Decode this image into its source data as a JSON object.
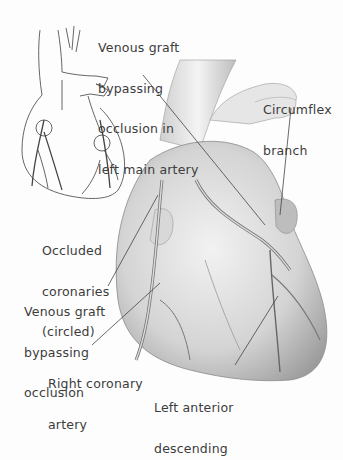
{
  "figure": {
    "background": "#fdfdfd",
    "ink": "#3c3c3c"
  },
  "labels": {
    "venous_graft_left_main": {
      "lines": [
        "Venous graft",
        "bypassing",
        "occlusion in",
        "left main artery"
      ]
    },
    "circumflex": {
      "lines": [
        "Circumflex",
        "branch"
      ]
    },
    "occluded": {
      "lines": [
        "Occluded",
        "coronaries",
        "(circled)"
      ]
    },
    "venous_graft_occlusion": {
      "lines": [
        "Venous graft",
        "bypassing",
        "occlusion"
      ]
    },
    "right_coronary": {
      "lines": [
        "Right coronary",
        "artery"
      ]
    },
    "lad": {
      "lines": [
        "Left anterior",
        "descending"
      ]
    }
  },
  "panels": {
    "inset": {
      "name": "small-heart-sketch",
      "description": "Line drawing of heart with occluded coronaries circled"
    },
    "main": {
      "name": "main-heart-illustration",
      "description": "Shaded heart with venous grafts attached to aorta"
    }
  }
}
